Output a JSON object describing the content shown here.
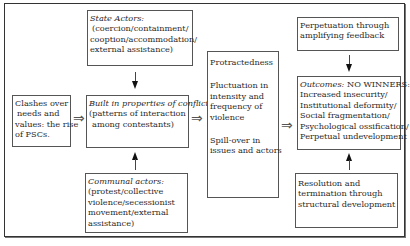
{
  "diagram": {
    "clashes": {
      "lines": [
        "Clashes over",
        "needs and",
        "values: the rise",
        "of PSCs."
      ]
    },
    "state_actors": {
      "title": "State Actors:",
      "lines": [
        "(coercion/containment/",
        "cooption/accommodation/",
        "external assistance)"
      ]
    },
    "built_in": {
      "title": "Built in properties of conflict",
      "lines": [
        "(patterns of interaction",
        "among contestants)"
      ]
    },
    "communal_actors": {
      "title": "Communal actors:",
      "lines": [
        "(protest/collective",
        "violence/secessionist",
        "movement/external",
        "assistance)"
      ]
    },
    "middle": {
      "p1": [
        "Protractedness"
      ],
      "p2": [
        "Fluctuation in",
        "intensity and",
        "frequency of",
        "violence"
      ],
      "p3": [
        "Spill-over in",
        "issues and actors"
      ]
    },
    "perpetuation": {
      "lines": [
        "Perpetuation through",
        "amplifying feedback"
      ]
    },
    "outcomes": {
      "title": "Outcomes:",
      "title_rest": " NO WINNERS:",
      "lines": [
        "Increased insecurity/",
        "Institutional deformity/",
        "Social fragmentation/",
        "Psychological ossification/",
        "Perpetual undevelopment"
      ]
    },
    "resolution": {
      "lines": [
        "Resolution and",
        "termination through",
        "structural development"
      ]
    },
    "arrow_glyph": "⇒"
  }
}
